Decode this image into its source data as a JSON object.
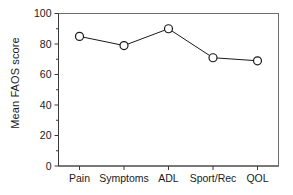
{
  "chart_data": {
    "type": "line",
    "title": "",
    "xlabel": "",
    "ylabel": "Mean FAOS score",
    "categories": [
      "Pain",
      "Symptoms",
      "ADL",
      "Sport/Rec",
      "QOL"
    ],
    "values": [
      85,
      79,
      90,
      71,
      69
    ],
    "series": [
      {
        "name": "Mean FAOS score",
        "values": [
          85,
          79,
          90,
          71,
          69
        ]
      }
    ],
    "ylim": [
      0,
      100
    ],
    "y_major_ticks": [
      0,
      20,
      40,
      60,
      80,
      100
    ],
    "y_minor_ticks": [
      10,
      30,
      50,
      70,
      90
    ],
    "y_tick_labels": [
      "0",
      "20",
      "40",
      "60",
      "80",
      "100"
    ],
    "grid": false,
    "legend": false,
    "legend_position": "none",
    "marker": "open-circle",
    "line_color": "#1a1a1a",
    "marker_fill": "#ffffff",
    "frame_color": "#6e6e6e",
    "background": "#ffffff"
  },
  "axes": {
    "y_title": "Mean FAOS score"
  }
}
